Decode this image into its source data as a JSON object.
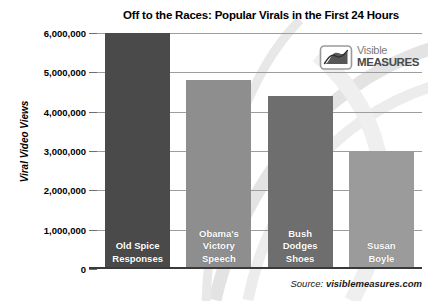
{
  "chart_data": {
    "type": "bar",
    "title": "Off to the Races: Popular Virals in the First 24 Hours",
    "xlabel": "",
    "ylabel": "Viral Video Views",
    "ylim": [
      0,
      6000000
    ],
    "grid": true,
    "legend": "none",
    "categories": [
      "Old Spice Responses",
      "Obama's Victory Speech",
      "Bush Dodges Shoes",
      "Susan Boyle"
    ],
    "values": [
      6000000,
      4800000,
      4400000,
      3000000
    ],
    "bar_labels": [
      [
        "Old Spice",
        "Responses"
      ],
      [
        "Obama's",
        "Victory",
        "Speech"
      ],
      [
        "Bush",
        "Dodges",
        "Shoes"
      ],
      [
        "Susan",
        "Boyle"
      ]
    ],
    "bar_colors": [
      "#4a4a4a",
      "#8e8e8e",
      "#6e6e6e",
      "#9b9b9b"
    ],
    "ytick_labels": [
      "6,000,000",
      "5,000,000",
      "4,000,000",
      "3,000,000",
      "2,000,000",
      "1,000,000",
      "0"
    ],
    "ytick_values": [
      6000000,
      5000000,
      4000000,
      3000000,
      2000000,
      1000000,
      0
    ]
  },
  "logo": {
    "mark_name": "visible-measures-logo-icon",
    "line1": "Visible",
    "line2": "MEASURES"
  },
  "source": {
    "label": "Source:",
    "domain": "visiblemeasures.com"
  }
}
